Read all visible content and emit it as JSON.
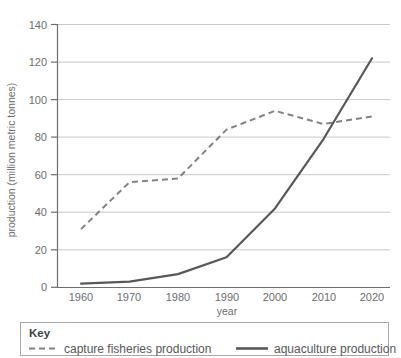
{
  "chart_data": {
    "type": "line",
    "title": "",
    "xlabel": "year",
    "ylabel": "production (million metric tonnes)",
    "x": [
      1960,
      1970,
      1980,
      1990,
      2000,
      2010,
      2020
    ],
    "xtick_labels": [
      "1960",
      "1970",
      "1980",
      "1990",
      "2000",
      "2010",
      "2020"
    ],
    "ytick_labels": [
      "0",
      "20",
      "40",
      "60",
      "80",
      "100",
      "120",
      "140"
    ],
    "yticks": [
      0,
      20,
      40,
      60,
      80,
      100,
      120,
      140
    ],
    "xlim": [
      1960,
      2020
    ],
    "ylim": [
      0,
      140
    ],
    "grid": "horizontal",
    "legend_position": "bottom",
    "series": [
      {
        "name": "capture fisheries production",
        "style": "dashed",
        "color": "#808285",
        "values": [
          31,
          56,
          58,
          84,
          94,
          87,
          91
        ]
      },
      {
        "name": "aquaculture production",
        "style": "solid",
        "color": "#58585a",
        "values": [
          2,
          3,
          7,
          16,
          42,
          79,
          122
        ]
      }
    ]
  },
  "legend": {
    "title": "Key",
    "entries": [
      {
        "label": "capture fisheries production",
        "swatch": "dashed-line-swatch"
      },
      {
        "label": "aquaculture production",
        "swatch": "solid-line-swatch"
      }
    ]
  },
  "colors": {
    "dashed_series": "#808285",
    "solid_series": "#58585a",
    "gridline": "#c8c9cb",
    "axis": "#6d6e70",
    "legend_border": "#a7a9ac",
    "text": "#58585a"
  }
}
